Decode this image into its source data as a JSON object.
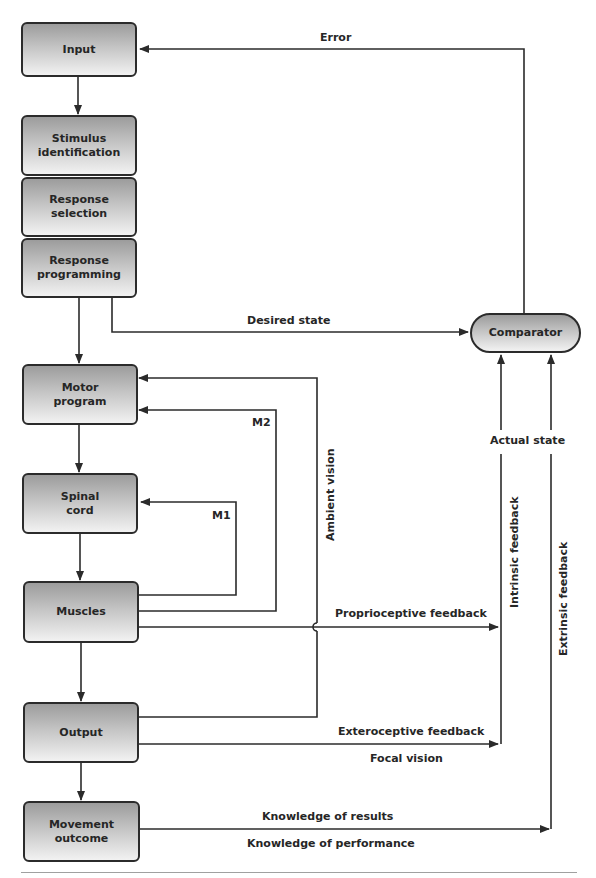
{
  "diagram": {
    "boxes": {
      "input": "Input",
      "stimulus_identification": "Stimulus identification",
      "response_selection": "Response selection",
      "response_programming": "Response programming",
      "motor_program": "Motor program",
      "spinal_cord": "Spinal cord",
      "muscles": "Muscles",
      "output": "Output",
      "movement_outcome": "Movement outcome",
      "comparator": "Comparator"
    },
    "labels": {
      "error": "Error",
      "desired_state": "Desired state",
      "actual_state": "Actual state",
      "m2": "M2",
      "m1": "M1",
      "ambient_vision": "Ambient vision",
      "intrinsic_feedback": "Intrinsic feedback",
      "extrinsic_feedback": "Extrinsic feedback",
      "proprioceptive_feedback": "Proprioceptive feedback",
      "exteroceptive_feedback": "Exteroceptive feedback",
      "focal_vision": "Focal vision",
      "knowledge_of_results": "Knowledge of results",
      "knowledge_of_performance": "Knowledge of performance"
    },
    "colors": {
      "line": "#2b2b2b",
      "box_top": "#9c9c9c",
      "box_bottom": "#f2f2f2",
      "rule": "#a0a0a0"
    }
  }
}
